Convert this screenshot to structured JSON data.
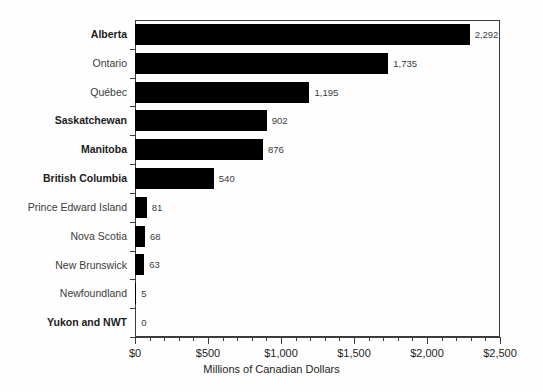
{
  "chart_data": {
    "type": "bar",
    "orientation": "horizontal",
    "title": "",
    "subtitle": "",
    "xlabel": "Millions of Canadian Dollars",
    "ylabel": "",
    "xlim": [
      0,
      2500
    ],
    "xticks": [
      0,
      500,
      1000,
      1500,
      2000,
      2500
    ],
    "xtick_labels": [
      "$0",
      "$500",
      "$1,000",
      "$1,500",
      "$2,000",
      "$2,500"
    ],
    "minor_tick_step": 100,
    "grid": false,
    "legend": null,
    "bar_color": "#000000",
    "frame_color": "#3c3c3c",
    "categories": [
      "Alberta",
      "Ontario",
      "Québec",
      "Saskatchewan",
      "Manitoba",
      "British Columbia",
      "Prince Edward Island",
      "Nova Scotia",
      "New Brunswick",
      "Newfoundland",
      "Yukon and NWT"
    ],
    "values": [
      2292,
      1735,
      1195,
      902,
      876,
      540,
      81,
      68,
      63,
      5,
      0
    ],
    "data_labels": [
      "2,292",
      "1,735",
      "1,195",
      "902",
      "876",
      "540",
      "81",
      "68",
      "63",
      "5",
      "0"
    ],
    "category_bold": [
      true,
      false,
      false,
      true,
      true,
      true,
      false,
      false,
      false,
      false,
      true
    ]
  }
}
